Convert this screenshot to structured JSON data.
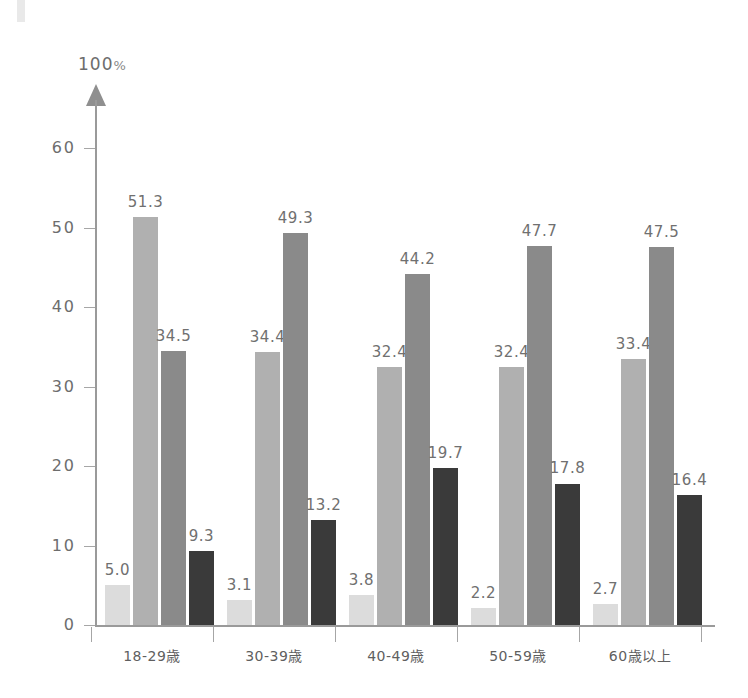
{
  "chart_data": {
    "type": "bar",
    "title": "",
    "xlabel": "",
    "ylabel": "",
    "unit_label": "100",
    "unit_symbol": "%",
    "ylim": [
      0,
      60
    ],
    "ytick_labels": [
      "0",
      "10",
      "20",
      "30",
      "40",
      "50",
      "60"
    ],
    "ytick_values": [
      0,
      10,
      20,
      30,
      40,
      50,
      60
    ],
    "grid": false,
    "legend_position": "none",
    "categories": [
      "18-29歳",
      "30-39歳",
      "40-49歳",
      "50-59歳",
      "60歳以上"
    ],
    "series": [
      {
        "name": "series-1",
        "color": "#dcdcdc",
        "values": [
          5.0,
          3.1,
          3.8,
          2.2,
          2.7
        ],
        "labels": [
          "5.0",
          "3.1",
          "3.8",
          "2.2",
          "2.7"
        ]
      },
      {
        "name": "series-2",
        "color": "#b0b0b0",
        "values": [
          51.3,
          34.4,
          32.4,
          32.4,
          33.4
        ],
        "labels": [
          "51.3",
          "34.4",
          "32.4",
          "32.4",
          "33.4"
        ]
      },
      {
        "name": "series-3",
        "color": "#8a8a8a",
        "values": [
          34.5,
          49.3,
          44.2,
          47.7,
          47.5
        ],
        "labels": [
          "34.5",
          "49.3",
          "44.2",
          "47.7",
          "47.5"
        ]
      },
      {
        "name": "series-4",
        "color": "#3a3a3a",
        "values": [
          9.3,
          13.2,
          19.7,
          17.8,
          16.4
        ],
        "labels": [
          "9.3",
          "13.2",
          "19.7",
          "17.8",
          "16.4"
        ]
      }
    ],
    "colors": {
      "axis": "#9a9a9a",
      "tick": "#a6a6a6",
      "data_label": "#707070",
      "category_label": "#5f5f5f",
      "axis_label": "#6d6d6d",
      "background": "#ffffff"
    }
  }
}
